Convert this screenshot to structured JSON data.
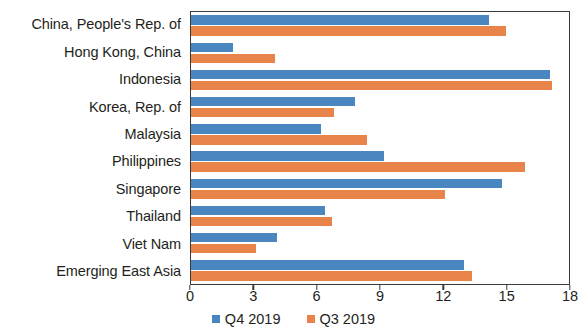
{
  "chart_data": {
    "type": "bar",
    "orientation": "horizontal",
    "title": "",
    "subtitle": "",
    "xlabel": "",
    "ylabel": "",
    "xlim": [
      0,
      18
    ],
    "xticks": [
      0,
      3,
      6,
      9,
      12,
      15,
      18
    ],
    "xtick_labels": [
      "0",
      "3",
      "6",
      "9",
      "12",
      "15",
      "18"
    ],
    "grid": false,
    "legend_position": "bottom-center",
    "categories": [
      "China, People's Rep. of",
      "Hong Kong, China",
      "Indonesia",
      "Korea, Rep. of",
      "Malaysia",
      "Philippines",
      "Singapore",
      "Thailand",
      "Viet Nam",
      "Emerging East Asia"
    ],
    "series": [
      {
        "name": "Q4 2019",
        "color": "#4a87c0",
        "values": [
          14.2,
          2.0,
          17.1,
          7.8,
          6.2,
          9.2,
          14.8,
          6.4,
          4.1,
          13.0
        ]
      },
      {
        "name": "Q3 2019",
        "color": "#e8834a",
        "values": [
          15.0,
          4.0,
          17.2,
          6.8,
          8.4,
          15.9,
          12.1,
          6.7,
          3.1,
          13.4
        ]
      }
    ]
  },
  "legend": {
    "items": [
      {
        "label": "Q4 2019",
        "color": "#4a87c0"
      },
      {
        "label": "Q3 2019",
        "color": "#e8834a"
      }
    ]
  }
}
